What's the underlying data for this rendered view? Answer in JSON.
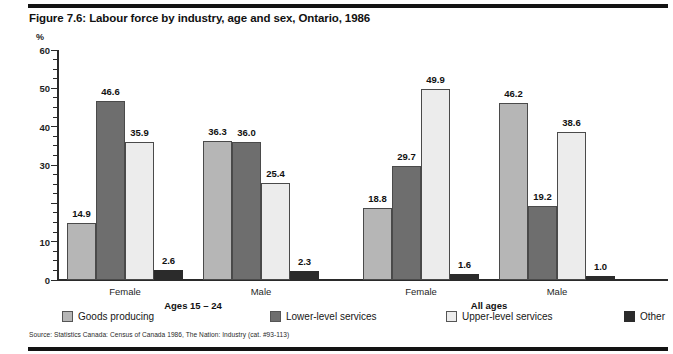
{
  "figure": {
    "title": "Figure 7.6: Labour force by industry, age and sex, Ontario, 1986",
    "unit": "%",
    "source": "Source: Statistics Canada: Census of Canada 1986, The Nation: Industry (cat. #93-113)"
  },
  "legend": [
    {
      "label": "Goods producing",
      "color": "#b6b6b6"
    },
    {
      "label": "Lower-level services",
      "color": "#6e6e6e"
    },
    {
      "label": "Upper-level services",
      "color": "#ececec"
    },
    {
      "label": "Other",
      "color": "#2b2b2b"
    }
  ],
  "supergroups": [
    {
      "label": "Ages 15 – 24"
    },
    {
      "label": "All ages"
    }
  ],
  "chart_data": {
    "type": "bar",
    "title": "Figure 7.6: Labour force by industry, age and sex, Ontario, 1986",
    "xlabel": "",
    "ylabel": "%",
    "ylim": [
      0,
      60
    ],
    "yticks": [
      0,
      10,
      20,
      30,
      40,
      50,
      60
    ],
    "ytick_labels": [
      "0",
      "10",
      "",
      "30",
      "40",
      "50",
      "60"
    ],
    "minor_tick_step": 2.5,
    "grid": false,
    "legend_position": "bottom",
    "categories": [
      "Female",
      "Male",
      "Female",
      "Male"
    ],
    "category_groups": [
      "Ages 15 – 24",
      "Ages 15 – 24",
      "All ages",
      "All ages"
    ],
    "series": [
      {
        "name": "Goods producing",
        "values": [
          14.9,
          36.3,
          18.8,
          46.2
        ]
      },
      {
        "name": "Lower-level services",
        "values": [
          46.6,
          36.0,
          29.7,
          19.2
        ]
      },
      {
        "name": "Upper-level services",
        "values": [
          35.9,
          25.4,
          49.9,
          38.6
        ]
      },
      {
        "name": "Other",
        "values": [
          2.6,
          2.3,
          1.6,
          1.0
        ]
      }
    ],
    "data_labels": [
      [
        "14.9",
        "46.6",
        "35.9",
        "2.6"
      ],
      [
        "36.3",
        "36.0",
        "25.4",
        "2.3"
      ],
      [
        "18.8",
        "29.7",
        "49.9",
        "1.6"
      ],
      [
        "46.2",
        "19.2",
        "38.6",
        "1.0"
      ]
    ],
    "source": "Source: Statistics Canada: Census of Canada 1986, The Nation: Industry (cat. #93-113)"
  }
}
